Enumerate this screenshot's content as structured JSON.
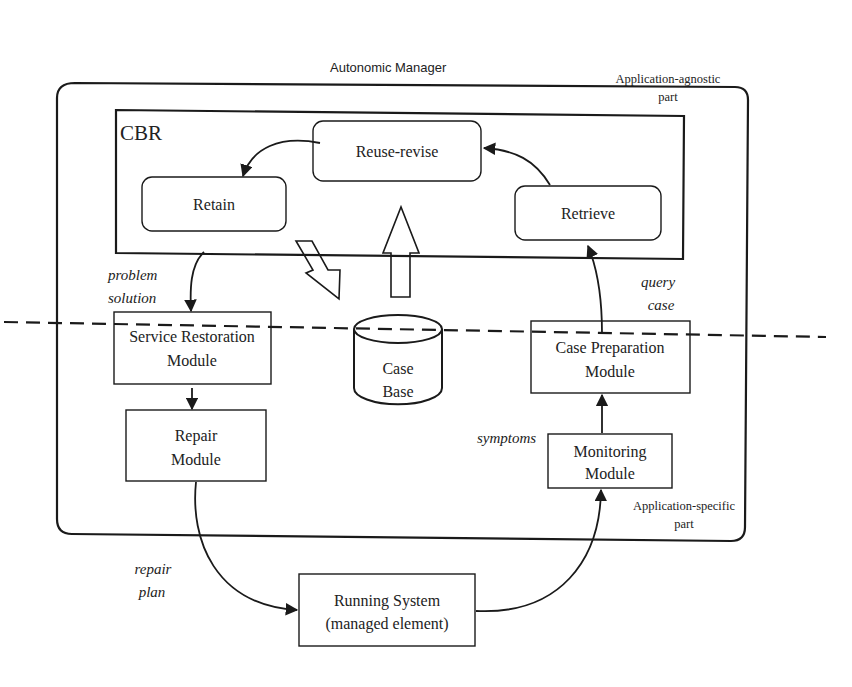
{
  "diagram": {
    "title": "Autonomic Manager",
    "regions": {
      "agnostic": {
        "line1": "Application-agnostic",
        "line2": "part"
      },
      "specific": {
        "line1": "Application-specific",
        "line2": "part"
      }
    },
    "cbr": {
      "label": "CBR",
      "steps": {
        "reuse": "Reuse-revise",
        "retain": "Retain",
        "retrieve": "Retrieve"
      }
    },
    "case_base": {
      "line1": "Case",
      "line2": "Base"
    },
    "modules": {
      "service_restoration": {
        "line1": "Service Restoration",
        "line2": "Module"
      },
      "repair": {
        "line1": "Repair",
        "line2": "Module"
      },
      "case_preparation": {
        "line1": "Case Preparation",
        "line2": "Module"
      },
      "monitoring": {
        "line1": "Monitoring",
        "line2": "Module"
      },
      "running_system": {
        "line1": "Running System",
        "line2": "(managed element)"
      }
    },
    "edge_labels": {
      "problem_solution": {
        "line1": "problem",
        "line2": "solution"
      },
      "query_case": {
        "line1": "query",
        "line2": "case"
      },
      "symptoms": "symptoms",
      "repair_plan": {
        "line1": "repair",
        "line2": "plan"
      }
    }
  }
}
